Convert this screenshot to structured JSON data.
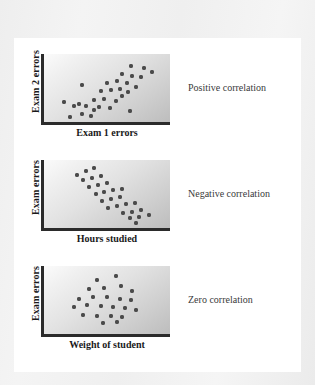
{
  "figure": {
    "background_color": "#f2f2f2",
    "card_color": "#ffffff",
    "dot_color": "#4a4a4a",
    "axis_color": "#2b2b2b"
  },
  "chart_data": [
    {
      "type": "scatter",
      "title": "",
      "caption": "Positive correlation",
      "xlabel": "Exam 1 errors",
      "ylabel": "Exam 2 errors",
      "xlim": [
        0,
        100
      ],
      "ylim": [
        0,
        100
      ],
      "grid": false,
      "axis_ticks": false,
      "legend": "none",
      "points": [
        [
          21,
          8
        ],
        [
          30,
          12
        ],
        [
          37,
          9
        ],
        [
          28,
          27
        ],
        [
          16,
          30
        ],
        [
          24,
          23
        ],
        [
          33,
          24
        ],
        [
          44,
          22
        ],
        [
          52,
          20
        ],
        [
          68,
          16
        ],
        [
          40,
          33
        ],
        [
          48,
          34
        ],
        [
          57,
          31
        ],
        [
          62,
          38
        ],
        [
          30,
          55
        ],
        [
          45,
          45
        ],
        [
          53,
          47
        ],
        [
          60,
          48
        ],
        [
          67,
          44
        ],
        [
          50,
          58
        ],
        [
          58,
          60
        ],
        [
          66,
          58
        ],
        [
          73,
          52
        ],
        [
          62,
          70
        ],
        [
          70,
          68
        ],
        [
          77,
          66
        ],
        [
          69,
          82
        ],
        [
          79,
          80
        ],
        [
          86,
          74
        ],
        [
          40,
          18
        ]
      ]
    },
    {
      "type": "scatter",
      "title": "",
      "caption": "Negative correlation",
      "xlabel": "Hours studied",
      "ylabel": "Exam errors",
      "xlim": [
        0,
        100
      ],
      "ylim": [
        0,
        100
      ],
      "grid": false,
      "axis_ticks": false,
      "legend": "none",
      "points": [
        [
          26,
          78
        ],
        [
          33,
          84
        ],
        [
          40,
          88
        ],
        [
          31,
          70
        ],
        [
          38,
          73
        ],
        [
          45,
          76
        ],
        [
          36,
          60
        ],
        [
          43,
          63
        ],
        [
          50,
          66
        ],
        [
          41,
          50
        ],
        [
          48,
          53
        ],
        [
          55,
          56
        ],
        [
          62,
          58
        ],
        [
          46,
          40
        ],
        [
          53,
          43
        ],
        [
          60,
          45
        ],
        [
          51,
          30
        ],
        [
          58,
          32
        ],
        [
          65,
          35
        ],
        [
          72,
          37
        ],
        [
          63,
          22
        ],
        [
          70,
          24
        ],
        [
          77,
          26
        ],
        [
          68,
          14
        ],
        [
          75,
          16
        ],
        [
          83,
          19
        ],
        [
          73,
          8
        ]
      ]
    },
    {
      "type": "scatter",
      "title": "",
      "caption": "Zero correlation",
      "xlabel": "Weight of student",
      "ylabel": "Exam errors",
      "xlim": [
        0,
        100
      ],
      "ylim": [
        0,
        100
      ],
      "grid": false,
      "axis_ticks": false,
      "legend": "none",
      "points": [
        [
          42,
          80
        ],
        [
          57,
          86
        ],
        [
          36,
          66
        ],
        [
          48,
          68
        ],
        [
          61,
          70
        ],
        [
          70,
          63
        ],
        [
          28,
          52
        ],
        [
          39,
          55
        ],
        [
          50,
          54
        ],
        [
          60,
          52
        ],
        [
          69,
          50
        ],
        [
          24,
          40
        ],
        [
          34,
          42
        ],
        [
          45,
          41
        ],
        [
          55,
          40
        ],
        [
          64,
          38
        ],
        [
          73,
          36
        ],
        [
          31,
          28
        ],
        [
          42,
          27
        ],
        [
          53,
          26
        ],
        [
          62,
          25
        ],
        [
          47,
          16
        ],
        [
          58,
          18
        ]
      ]
    }
  ],
  "panels": [
    {
      "ylabel": "Exam 2 errors",
      "xlabel": "Exam 1 errors",
      "caption": "Positive correlation"
    },
    {
      "ylabel": "Exam errors",
      "xlabel": "Hours studied",
      "caption": "Negative correlation"
    },
    {
      "ylabel": "Exam errors",
      "xlabel": "Weight of student",
      "caption": "Zero correlation"
    }
  ]
}
